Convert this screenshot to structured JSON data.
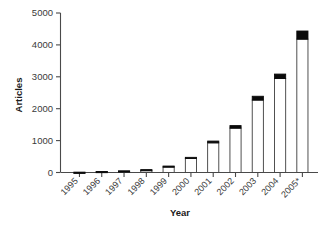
{
  "chart_data": {
    "type": "bar",
    "title": "",
    "subtitle": "",
    "xlabel": "Year",
    "ylabel": "Articles",
    "categories": [
      "1995",
      "1996",
      "1997",
      "1998",
      "1999",
      "2000",
      "2001",
      "2002",
      "2003",
      "2004",
      "2005*"
    ],
    "series": [
      {
        "name": "lower-segment",
        "color": "#ffffff",
        "values": [
          4,
          22,
          38,
          72,
          180,
          440,
          930,
          1390,
          2270,
          2945,
          4180
        ]
      },
      {
        "name": "upper-segment",
        "color": "#0a0a0a",
        "values": [
          6,
          10,
          14,
          18,
          22,
          35,
          55,
          80,
          120,
          140,
          255
        ]
      }
    ],
    "totals": [
      10,
      32,
      52,
      90,
      202,
      475,
      985,
      1470,
      2390,
      3085,
      4435
    ],
    "ylim": [
      0,
      5000
    ],
    "yticks": [
      0,
      1000,
      2000,
      3000,
      4000,
      5000
    ],
    "ytick_labels": [
      "0",
      "1000",
      "2000",
      "3000",
      "4000",
      "5000"
    ],
    "grid": false,
    "legend": "none",
    "xtick_rotation": 45
  },
  "axes": {
    "y_title": "Articles",
    "x_title": "Year"
  },
  "footnote": ""
}
